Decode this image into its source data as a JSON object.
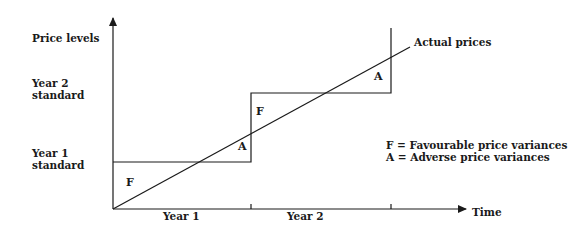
{
  "diagram": {
    "y_axis_label": "Price levels",
    "x_axis_label": "Time",
    "level_labels": {
      "year2_line1": "Year 2",
      "year2_line2": "standard",
      "year1_line1": "Year 1",
      "year1_line2": "standard"
    },
    "period_labels": [
      "Year 1",
      "Year 2"
    ],
    "series_label": "Actual prices",
    "region_marks": {
      "year1_favourable": "F",
      "year1_adverse": "A",
      "year2_favourable": "F",
      "year2_adverse": "A"
    },
    "legend": [
      "F = Favourable price variances",
      "A = Adverse price variances"
    ],
    "colors": {
      "ink": "#1a1a1a",
      "background": "#ffffff"
    }
  }
}
